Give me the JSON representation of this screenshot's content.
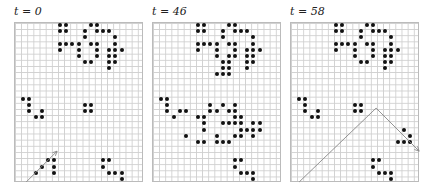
{
  "figure": {
    "cell_size": 6.15,
    "cols": 21,
    "rows": 26,
    "panels": [
      {
        "label": "t = 0",
        "origin": [
          14,
          22
        ],
        "cells": [
          [
            7,
            1
          ],
          [
            8,
            1
          ],
          [
            12,
            1
          ],
          [
            13,
            1
          ],
          [
            7,
            2
          ],
          [
            8,
            2
          ],
          [
            11,
            2
          ],
          [
            13,
            2
          ],
          [
            14,
            2
          ],
          [
            15,
            2
          ],
          [
            11,
            3
          ],
          [
            16,
            3
          ],
          [
            7,
            4
          ],
          [
            8,
            4
          ],
          [
            9,
            4
          ],
          [
            10,
            4
          ],
          [
            12,
            4
          ],
          [
            13,
            4
          ],
          [
            16,
            4
          ],
          [
            7,
            5
          ],
          [
            10,
            5
          ],
          [
            13,
            5
          ],
          [
            15,
            5
          ],
          [
            16,
            5
          ],
          [
            17,
            5
          ],
          [
            10,
            6
          ],
          [
            13,
            6
          ],
          [
            15,
            6
          ],
          [
            16,
            6
          ],
          [
            11,
            7
          ],
          [
            12,
            7
          ],
          [
            15,
            7
          ],
          [
            16,
            7
          ],
          [
            15,
            8
          ],
          [
            1,
            13
          ],
          [
            2,
            13
          ],
          [
            2,
            14
          ],
          [
            2,
            15
          ],
          [
            4,
            15
          ],
          [
            3,
            16
          ],
          [
            4,
            16
          ],
          [
            11,
            14
          ],
          [
            12,
            14
          ],
          [
            11,
            15
          ],
          [
            12,
            15
          ],
          [
            4,
            24
          ],
          [
            5,
            23
          ],
          [
            6,
            23
          ],
          [
            6,
            24
          ],
          [
            6,
            25
          ],
          [
            3,
            25
          ],
          [
            14,
            23
          ],
          [
            15,
            23
          ],
          [
            14,
            24
          ],
          [
            15,
            25
          ],
          [
            16,
            25
          ],
          [
            17,
            25
          ],
          [
            17,
            26
          ]
        ],
        "arrow": [
          [
            2,
            27
          ],
          [
            7,
            22
          ]
        ]
      },
      {
        "label": "t = 46",
        "origin": [
          152,
          22
        ],
        "cells": [
          [
            7,
            1
          ],
          [
            8,
            1
          ],
          [
            12,
            1
          ],
          [
            13,
            1
          ],
          [
            7,
            2
          ],
          [
            8,
            2
          ],
          [
            11,
            2
          ],
          [
            13,
            2
          ],
          [
            14,
            2
          ],
          [
            15,
            2
          ],
          [
            11,
            3
          ],
          [
            16,
            3
          ],
          [
            7,
            4
          ],
          [
            8,
            4
          ],
          [
            9,
            4
          ],
          [
            10,
            4
          ],
          [
            12,
            4
          ],
          [
            13,
            4
          ],
          [
            16,
            4
          ],
          [
            7,
            5
          ],
          [
            10,
            5
          ],
          [
            13,
            5
          ],
          [
            15,
            5
          ],
          [
            16,
            5
          ],
          [
            17,
            5
          ],
          [
            10,
            6
          ],
          [
            12,
            6
          ],
          [
            13,
            6
          ],
          [
            15,
            6
          ],
          [
            16,
            6
          ],
          [
            11,
            7
          ],
          [
            12,
            7
          ],
          [
            15,
            7
          ],
          [
            16,
            7
          ],
          [
            11,
            8
          ],
          [
            12,
            8
          ],
          [
            15,
            8
          ],
          [
            10,
            9
          ],
          [
            11,
            9
          ],
          [
            12,
            9
          ],
          [
            1,
            13
          ],
          [
            2,
            13
          ],
          [
            2,
            14
          ],
          [
            2,
            15
          ],
          [
            4,
            15
          ],
          [
            5,
            15
          ],
          [
            3,
            16
          ],
          [
            7,
            16
          ],
          [
            8,
            16
          ],
          [
            8,
            17
          ],
          [
            8,
            18
          ],
          [
            5,
            19
          ],
          [
            7,
            20
          ],
          [
            8,
            20
          ],
          [
            9,
            14
          ],
          [
            11,
            14
          ],
          [
            13,
            14
          ],
          [
            9,
            15
          ],
          [
            10,
            15
          ],
          [
            12,
            15
          ],
          [
            13,
            15
          ],
          [
            13,
            16
          ],
          [
            14,
            16
          ],
          [
            11,
            17
          ],
          [
            12,
            17
          ],
          [
            13,
            17
          ],
          [
            14,
            17
          ],
          [
            16,
            17
          ],
          [
            17,
            17
          ],
          [
            14,
            18
          ],
          [
            15,
            18
          ],
          [
            16,
            18
          ],
          [
            17,
            18
          ],
          [
            10,
            19
          ],
          [
            13,
            19
          ],
          [
            14,
            19
          ],
          [
            16,
            19
          ],
          [
            10,
            20
          ],
          [
            11,
            20
          ],
          [
            12,
            20
          ],
          [
            13,
            23
          ],
          [
            14,
            23
          ],
          [
            13,
            24
          ],
          [
            14,
            25
          ],
          [
            15,
            25
          ],
          [
            16,
            25
          ],
          [
            16,
            26
          ]
        ],
        "arrow": null
      },
      {
        "label": "t = 58",
        "origin": [
          290,
          22
        ],
        "cells": [
          [
            7,
            1
          ],
          [
            8,
            1
          ],
          [
            12,
            1
          ],
          [
            13,
            1
          ],
          [
            7,
            2
          ],
          [
            8,
            2
          ],
          [
            11,
            2
          ],
          [
            13,
            2
          ],
          [
            14,
            2
          ],
          [
            15,
            2
          ],
          [
            11,
            3
          ],
          [
            16,
            3
          ],
          [
            7,
            4
          ],
          [
            8,
            4
          ],
          [
            9,
            4
          ],
          [
            10,
            4
          ],
          [
            12,
            4
          ],
          [
            13,
            4
          ],
          [
            16,
            4
          ],
          [
            7,
            5
          ],
          [
            10,
            5
          ],
          [
            13,
            5
          ],
          [
            15,
            5
          ],
          [
            16,
            5
          ],
          [
            17,
            5
          ],
          [
            10,
            6
          ],
          [
            13,
            6
          ],
          [
            15,
            6
          ],
          [
            16,
            6
          ],
          [
            11,
            7
          ],
          [
            12,
            7
          ],
          [
            15,
            7
          ],
          [
            16,
            7
          ],
          [
            15,
            8
          ],
          [
            1,
            13
          ],
          [
            2,
            13
          ],
          [
            2,
            14
          ],
          [
            2,
            15
          ],
          [
            4,
            15
          ],
          [
            3,
            16
          ],
          [
            4,
            16
          ],
          [
            10,
            14
          ],
          [
            11,
            14
          ],
          [
            10,
            15
          ],
          [
            11,
            15
          ],
          [
            18,
            18
          ],
          [
            19,
            19
          ],
          [
            17,
            20
          ],
          [
            18,
            20
          ],
          [
            19,
            20
          ],
          [
            13,
            23
          ],
          [
            14,
            23
          ],
          [
            13,
            24
          ],
          [
            14,
            25
          ],
          [
            15,
            25
          ],
          [
            16,
            25
          ],
          [
            16,
            26
          ]
        ],
        "arrow": [
          [
            1.5,
            27
          ],
          [
            14,
            15
          ],
          [
            21,
            22
          ]
        ]
      }
    ]
  }
}
